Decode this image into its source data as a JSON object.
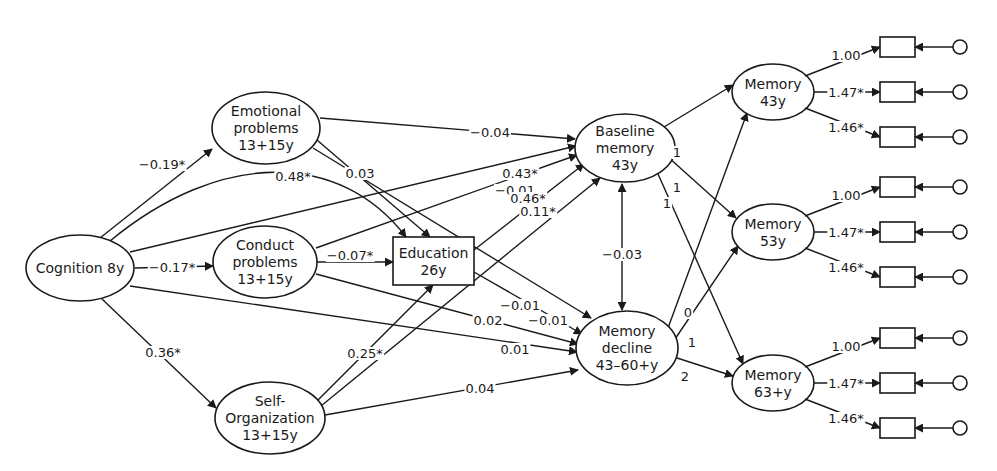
{
  "diagram": {
    "type": "structural-equation-path-diagram",
    "nodes": [
      {
        "id": "cog",
        "shape": "ellipse",
        "lines": [
          "Cognition 8y"
        ]
      },
      {
        "id": "emo",
        "shape": "ellipse",
        "lines": [
          "Emotional",
          "problems",
          "13+15y"
        ]
      },
      {
        "id": "con",
        "shape": "ellipse",
        "lines": [
          "Conduct",
          "problems",
          "13+15y"
        ]
      },
      {
        "id": "self",
        "shape": "ellipse",
        "lines": [
          "Self-",
          "Organization",
          "13+15y"
        ]
      },
      {
        "id": "edu",
        "shape": "rect",
        "lines": [
          "Education",
          "26y"
        ]
      },
      {
        "id": "base",
        "shape": "ellipse",
        "lines": [
          "Baseline",
          "memory",
          "43y"
        ]
      },
      {
        "id": "decl",
        "shape": "ellipse",
        "lines": [
          "Memory",
          "decline",
          "43–60+y"
        ]
      },
      {
        "id": "m43",
        "shape": "ellipse",
        "lines": [
          "Memory",
          "43y"
        ]
      },
      {
        "id": "m53",
        "shape": "ellipse",
        "lines": [
          "Memory",
          "53y"
        ]
      },
      {
        "id": "m63",
        "shape": "ellipse",
        "lines": [
          "Memory",
          "63+y"
        ]
      }
    ],
    "edges": [
      {
        "from": "cog",
        "to": "emo",
        "label": "−0.19*"
      },
      {
        "from": "cog",
        "to": "con",
        "label": "−0.17*"
      },
      {
        "from": "cog",
        "to": "self",
        "label": "0.36*"
      },
      {
        "from": "cog",
        "to": "edu",
        "label": "0.48*"
      },
      {
        "from": "cog",
        "to": "base",
        "label": "0.43*"
      },
      {
        "from": "cog",
        "to": "decl",
        "label": "0.01"
      },
      {
        "from": "emo",
        "to": "base",
        "label": "−0.04"
      },
      {
        "from": "emo",
        "to": "edu",
        "label": "0.03"
      },
      {
        "from": "emo",
        "to": "decl",
        "label": "−0.01"
      },
      {
        "from": "con",
        "to": "edu",
        "label": "−0.07*"
      },
      {
        "from": "con",
        "to": "base",
        "label": "−0.01"
      },
      {
        "from": "con",
        "to": "decl",
        "label": "0.02"
      },
      {
        "from": "self",
        "to": "edu",
        "label": "0.25*"
      },
      {
        "from": "self",
        "to": "base",
        "label": "0.11*"
      },
      {
        "from": "self",
        "to": "decl",
        "label": "0.04"
      },
      {
        "from": "edu",
        "to": "base",
        "label": "0.46*"
      },
      {
        "from": "edu",
        "to": "decl",
        "label": "−0.01"
      },
      {
        "from": "base",
        "to": "decl",
        "label": "−0.03",
        "bidirectional": true
      },
      {
        "from": "base",
        "to": "m43",
        "label": "1"
      },
      {
        "from": "base",
        "to": "m53",
        "label": "1"
      },
      {
        "from": "base",
        "to": "m63",
        "label": "1"
      },
      {
        "from": "decl",
        "to": "m43",
        "label": "0"
      },
      {
        "from": "decl",
        "to": "m53",
        "label": "1"
      },
      {
        "from": "decl",
        "to": "m63",
        "label": "2"
      }
    ],
    "indicators": [
      {
        "latent": "m43",
        "loadings": [
          "1.00",
          "1.47*",
          "1.46*"
        ]
      },
      {
        "latent": "m53",
        "loadings": [
          "1.00",
          "1.47*",
          "1.46*"
        ]
      },
      {
        "latent": "m63",
        "loadings": [
          "1.00",
          "1.47*",
          "1.46*"
        ]
      }
    ]
  }
}
